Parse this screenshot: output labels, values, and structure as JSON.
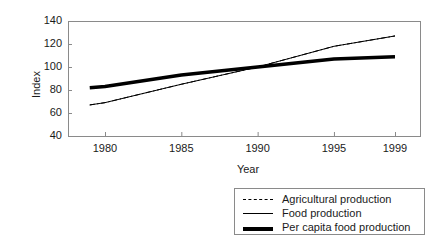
{
  "chart_data": {
    "type": "line",
    "title": "",
    "xlabel": "Year",
    "ylabel": "Index",
    "xlim": [
      1979,
      1999
    ],
    "ylim": [
      40,
      140
    ],
    "ytick_labels": [
      "140",
      "120",
      "100",
      "80",
      "60",
      "40"
    ],
    "ytick_values": [
      140,
      120,
      100,
      80,
      60,
      40
    ],
    "xtick_labels": [
      "1980",
      "1985",
      "1990",
      "1995",
      "1999"
    ],
    "xtick_values": [
      1980,
      1985,
      1990,
      1995,
      1999
    ],
    "grid": false,
    "legend_position": "below-right",
    "x": [
      1979,
      1980,
      1985,
      1990,
      1995,
      1999
    ],
    "series": [
      {
        "name": "Agricultural production",
        "style": "dashed",
        "color": "#000000",
        "width": 1,
        "values": [
          67,
          69,
          85,
          100,
          118,
          127
        ]
      },
      {
        "name": "Food production",
        "style": "solid",
        "color": "#000000",
        "width": 1,
        "values": [
          67,
          69,
          85,
          100,
          118,
          127
        ]
      },
      {
        "name": "Per capita food production",
        "style": "solid",
        "color": "#000000",
        "width": 3.5,
        "values": [
          82,
          83,
          93,
          100,
          107,
          109
        ]
      }
    ]
  },
  "legend": {
    "items": [
      {
        "label": "Agricultural production",
        "swatch": "dashed-line-swatch"
      },
      {
        "label": "Food production",
        "swatch": "thin-line-swatch"
      },
      {
        "label": "Per capita food production",
        "swatch": "thick-line-swatch"
      }
    ]
  },
  "colors": {
    "axis": "#8a8a8a",
    "text": "#1a1a1a",
    "line": "#000000",
    "background": "#ffffff"
  }
}
